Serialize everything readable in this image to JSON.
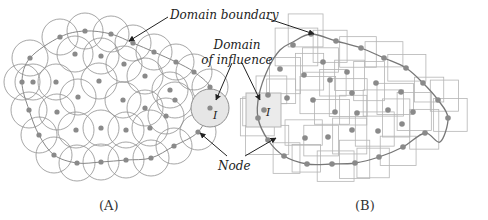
{
  "panels": [
    {
      "id": "A",
      "caption": "(A)",
      "influence_shape": "circle",
      "influence_radius": 18,
      "influence_label": "I",
      "nodes": [
        [
          60,
          37
        ],
        [
          85,
          31
        ],
        [
          111,
          34
        ],
        [
          133,
          43
        ],
        [
          154,
          52
        ],
        [
          176,
          62
        ],
        [
          194,
          72
        ],
        [
          210,
          87
        ],
        [
          30,
          58
        ],
        [
          22,
          82
        ],
        [
          29,
          110
        ],
        [
          39,
          135
        ],
        [
          54,
          155
        ],
        [
          77,
          163
        ],
        [
          101,
          162
        ],
        [
          126,
          160
        ],
        [
          151,
          158
        ],
        [
          174,
          146
        ],
        [
          198,
          132
        ],
        [
          75,
          54
        ],
        [
          101,
          56
        ],
        [
          124,
          64
        ],
        [
          145,
          76
        ],
        [
          170,
          90
        ],
        [
          33,
          82
        ],
        [
          56,
          82
        ],
        [
          78,
          97
        ],
        [
          99,
          81
        ],
        [
          123,
          100
        ],
        [
          145,
          108
        ],
        [
          166,
          116
        ],
        [
          175,
          100
        ],
        [
          57,
          112
        ],
        [
          76,
          130
        ],
        [
          101,
          128
        ],
        [
          126,
          130
        ],
        [
          150,
          128
        ]
      ],
      "boundary": [
        [
          30,
          58
        ],
        [
          60,
          37
        ],
        [
          85,
          31
        ],
        [
          111,
          34
        ],
        [
          133,
          43
        ],
        [
          154,
          52
        ],
        [
          176,
          62
        ],
        [
          194,
          72
        ],
        [
          210,
          87
        ],
        [
          210,
          108
        ],
        [
          198,
          132
        ],
        [
          174,
          146
        ],
        [
          151,
          158
        ],
        [
          126,
          160
        ],
        [
          101,
          162
        ],
        [
          77,
          163
        ],
        [
          54,
          155
        ],
        [
          39,
          135
        ],
        [
          29,
          110
        ],
        [
          22,
          82
        ]
      ]
    },
    {
      "id": "B",
      "caption": "(B)",
      "influence_shape": "rectangle",
      "influence_label": "I",
      "nodes": [
        [
          311,
          34
        ],
        [
          336,
          41
        ],
        [
          361,
          48
        ],
        [
          384,
          58
        ],
        [
          406,
          68
        ],
        [
          423,
          83
        ],
        [
          438,
          100
        ],
        [
          448,
          118
        ],
        [
          425,
          133
        ],
        [
          403,
          147
        ],
        [
          379,
          157
        ],
        [
          355,
          163
        ],
        [
          332,
          164
        ],
        [
          307,
          164
        ],
        [
          284,
          156
        ],
        [
          268,
          140
        ],
        [
          258,
          118
        ],
        [
          268,
          95
        ],
        [
          280,
          69
        ],
        [
          293,
          45
        ],
        [
          323,
          62
        ],
        [
          347,
          72
        ],
        [
          376,
          83
        ],
        [
          401,
          92
        ],
        [
          413,
          112
        ],
        [
          304,
          75
        ],
        [
          330,
          80
        ],
        [
          352,
          93
        ],
        [
          287,
          98
        ],
        [
          313,
          100
        ],
        [
          335,
          112
        ],
        [
          357,
          113
        ],
        [
          388,
          110
        ],
        [
          305,
          138
        ],
        [
          328,
          137
        ],
        [
          352,
          130
        ],
        [
          378,
          131
        ],
        [
          402,
          124
        ],
        [
          264,
          110
        ]
      ],
      "boundary_points": [
        [
          311,
          34
        ],
        [
          336,
          41
        ],
        [
          361,
          48
        ],
        [
          384,
          58
        ],
        [
          406,
          68
        ],
        [
          423,
          83
        ],
        [
          438,
          100
        ],
        [
          448,
          118
        ],
        [
          440,
          142
        ],
        [
          425,
          133
        ],
        [
          403,
          147
        ],
        [
          379,
          157
        ],
        [
          355,
          163
        ],
        [
          332,
          164
        ],
        [
          307,
          164
        ],
        [
          284,
          156
        ],
        [
          268,
          140
        ],
        [
          258,
          118
        ],
        [
          259,
          95
        ],
        [
          268,
          69
        ],
        [
          280,
          50
        ],
        [
          293,
          42
        ]
      ]
    }
  ],
  "annotations": {
    "domain_boundary": "Domain boundary",
    "domain_of_influence_line1": "Domain",
    "domain_of_influence_line2": "of influence",
    "node": "Node",
    "influence_marker_A": "I",
    "influence_marker_B": "I"
  },
  "colors": {
    "node": "#8a8a8a",
    "circle_stroke": "#8f8f8f",
    "rect_stroke": "#b5b5b5",
    "boundary": "#777777",
    "arrow": "#222222",
    "influence_fill": "#e9e9e9"
  }
}
